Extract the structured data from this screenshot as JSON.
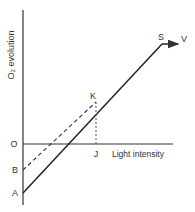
{
  "diagram": {
    "y_axis_label": "O₂ evolution",
    "x_axis_label": "Light intensity",
    "points": {
      "origin": "O",
      "A": "A",
      "B": "B",
      "K": "K",
      "J": "J",
      "S": "S",
      "V": "V"
    },
    "lines": [
      {
        "name": "solid-line-A-to-S",
        "from": "A",
        "to": "S",
        "style": "solid"
      },
      {
        "name": "dashed-line-B-to-K",
        "from": "B",
        "to": "K",
        "style": "dashed"
      },
      {
        "name": "dashed-drop-K-to-J",
        "from": "K",
        "to": "J",
        "style": "dashed"
      },
      {
        "name": "arrow-S-to-V",
        "from": "S",
        "to": "V",
        "style": "solid-arrow"
      }
    ],
    "colors": {
      "ink": "#333333"
    }
  }
}
